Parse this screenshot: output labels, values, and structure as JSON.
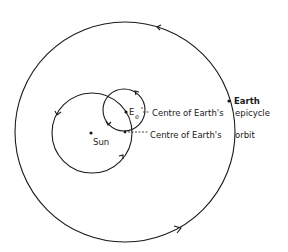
{
  "diagram": {
    "colors": {
      "ink": "#1a1a1a",
      "background": "#ffffff"
    },
    "circles": {
      "earth_orbit": {
        "cx": 125,
        "cy": 132,
        "r": 110
      },
      "sun_circle": {
        "cx": 92,
        "cy": 133,
        "r": 40
      },
      "epicycle": {
        "cx": 124,
        "cy": 110,
        "r": 21
      }
    },
    "points": {
      "sun": {
        "x": 91,
        "y": 133
      },
      "earth": {
        "x": 229,
        "y": 101
      },
      "epicycle_centre": {
        "x": 126,
        "y": 112
      },
      "orbit_centre": {
        "x": 125,
        "y": 132
      }
    },
    "labels": {
      "sun": "Sun",
      "earth": "Earth",
      "epicycle_centre_symbol": "E",
      "epicycle_centre_subscript": "e",
      "epicycle_centre_line1": "Centre of Earth's",
      "epicycle_centre_line2": "epicycle",
      "orbit_centre_line1": "Centre of Earth's",
      "orbit_centre_line2": "orbit"
    },
    "direction": "counterclockwise"
  }
}
